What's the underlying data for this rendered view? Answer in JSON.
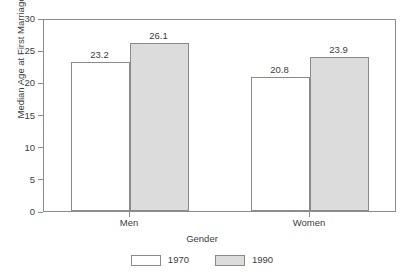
{
  "chart_data": {
    "type": "bar",
    "title": "",
    "subtitle": "",
    "xlabel": "Gender",
    "ylabel": "Median Age at First Marriage",
    "categories": [
      "Men",
      "Women"
    ],
    "series": [
      {
        "name": "1970",
        "values": [
          23.2,
          20.8
        ],
        "color": "#ffffff"
      },
      {
        "name": "1990",
        "values": [
          26.1,
          23.9
        ],
        "color": "#dcdcdc"
      }
    ],
    "value_labels": [
      [
        "23.2",
        "26.1"
      ],
      [
        "20.8",
        "23.9"
      ]
    ],
    "ylim": [
      0,
      30
    ],
    "yticks": [
      0,
      5,
      10,
      15,
      20,
      25,
      30
    ],
    "ytick_labels": [
      "0",
      "5",
      "10",
      "15",
      "20",
      "25",
      "30"
    ],
    "grid": false,
    "legend_position": "bottom-center",
    "frame": true,
    "border_color": "#8a8a8a",
    "text_color": "#3d3d3d"
  }
}
